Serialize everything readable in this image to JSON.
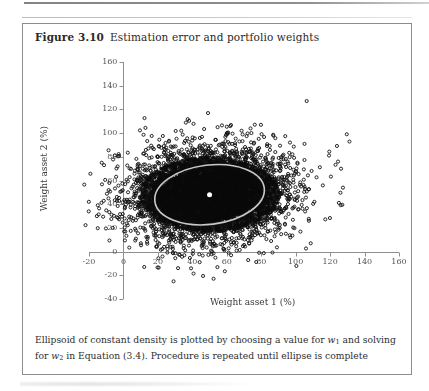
{
  "figure": {
    "number": "Figure 3.10",
    "title": "Estimation error and portfolio weights",
    "caption_line1_a": "Ellipsoid of constant density is plotted by choosing a value for ",
    "caption_w1": "w",
    "caption_w1_sub": "1",
    "caption_line1_b": " and solving for ",
    "caption_w2": "w",
    "caption_w2_sub": "2",
    "caption_line1_c": " in",
    "caption_line2": "Equation (3.4). Procedure is repeated until ellipse is complete"
  },
  "chart_data": {
    "type": "scatter",
    "title": "Estimation error and portfolio weights",
    "xlabel": "Weight asset 1 (%)",
    "ylabel": "Weight asset 2 (%)",
    "xlim": [
      -20,
      160
    ],
    "ylim": [
      -40,
      160
    ],
    "xticks": [
      -20,
      0,
      20,
      40,
      60,
      80,
      100,
      120,
      140,
      160
    ],
    "yticks": [
      -40,
      -20,
      0,
      20,
      40,
      60,
      80,
      100,
      120,
      140,
      160
    ],
    "xtick_labels": [
      "-20",
      "0",
      "20",
      "40",
      "60",
      "80",
      "100",
      "120",
      "140",
      "160"
    ],
    "ytick_labels": [
      "-40",
      "-20",
      "0",
      "20",
      "40",
      "60",
      "80",
      "100",
      "120",
      "140",
      "160"
    ],
    "grid": false,
    "legend": "none",
    "axis_style": "crossing-at-origin",
    "marker": {
      "shape": "open-circle",
      "size_px": 3.1,
      "color": "#111111",
      "fill": "none"
    },
    "cloud": {
      "n_points": 4000,
      "center": [
        50,
        48
      ],
      "sd_x": 23,
      "sd_y": 20,
      "correlation": 0.08,
      "description": "Dense bivariate normal cloud of simulated optimal portfolio weights; core saturates to solid black, tails thin out to isolated circles reaching about x=145 and y=140"
    },
    "ellipse": {
      "label": "ellipsoid of constant density",
      "center": [
        50,
        48
      ],
      "semi_axis_x": 32,
      "semi_axis_y": 25,
      "rotation_deg": -7,
      "color": "#c9c9c9",
      "linewidth_px": 1.6
    },
    "center_marker": {
      "at": [
        50,
        48
      ],
      "color": "#ffffff",
      "shape": "dot",
      "size_px": 5
    }
  }
}
